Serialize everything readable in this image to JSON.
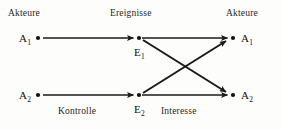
{
  "diagram": {
    "headers": {
      "left": "Akteure",
      "middle": "Ereignisse",
      "right": "Akteure"
    },
    "nodes": [
      {
        "id": "a1-left",
        "label": "A",
        "subscript": "1",
        "column": "left",
        "x": 38,
        "y": 38
      },
      {
        "id": "a2-left",
        "label": "A",
        "subscript": "2",
        "column": "left",
        "x": 38,
        "y": 95
      },
      {
        "id": "e1",
        "label": "E",
        "subscript": "1",
        "column": "middle",
        "x": 139,
        "y": 38
      },
      {
        "id": "e2",
        "label": "E",
        "subscript": "2",
        "column": "middle",
        "x": 139,
        "y": 95
      },
      {
        "id": "a1-right",
        "label": "A",
        "subscript": "1",
        "column": "right",
        "x": 233,
        "y": 38
      },
      {
        "id": "a2-right",
        "label": "A",
        "subscript": "2",
        "column": "right",
        "x": 233,
        "y": 95
      }
    ],
    "edges": [
      {
        "id": "edge-a1-e1",
        "from": "a1-left",
        "to": "e1",
        "group": "Kontrolle"
      },
      {
        "id": "edge-a2-e2",
        "from": "a2-left",
        "to": "e2",
        "group": "Kontrolle"
      },
      {
        "id": "edge-e1-a1",
        "from": "e1",
        "to": "a1-right",
        "group": "Interesse"
      },
      {
        "id": "edge-e1-a2",
        "from": "e1",
        "to": "a2-right",
        "group": "Interesse"
      },
      {
        "id": "edge-e2-a1",
        "from": "e2",
        "to": "a1-right",
        "group": "Interesse"
      },
      {
        "id": "edge-e2-a2",
        "from": "e2",
        "to": "a2-right",
        "group": "Interesse"
      }
    ],
    "edge_labels": {
      "left": "Kontrolle",
      "right": "Interesse"
    },
    "colors": {
      "background": "#fdfdfb",
      "ink": "#1a1a1a",
      "text": "#262626"
    }
  }
}
